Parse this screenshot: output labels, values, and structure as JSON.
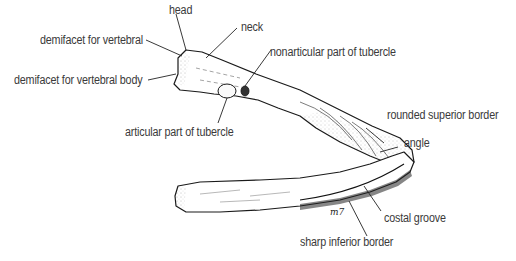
{
  "figure": {
    "signature": "m7",
    "labels": [
      {
        "id": "head",
        "text": "head"
      },
      {
        "id": "neck",
        "text": "neck"
      },
      {
        "id": "demifacet-vertebral",
        "text": "demifacet for vertebral"
      },
      {
        "id": "demifacet-vertebral-body",
        "text": "demifacet for vertebral body"
      },
      {
        "id": "nonarticular-tubercle",
        "text": "nonarticular part of tubercle"
      },
      {
        "id": "articular-tubercle",
        "text": "articular part of tubercle"
      },
      {
        "id": "rounded-superior-border",
        "text": "rounded superior border"
      },
      {
        "id": "angle",
        "text": "angle"
      },
      {
        "id": "costal-groove",
        "text": "costal groove"
      },
      {
        "id": "sharp-inferior-border",
        "text": "sharp inferior border"
      }
    ]
  }
}
